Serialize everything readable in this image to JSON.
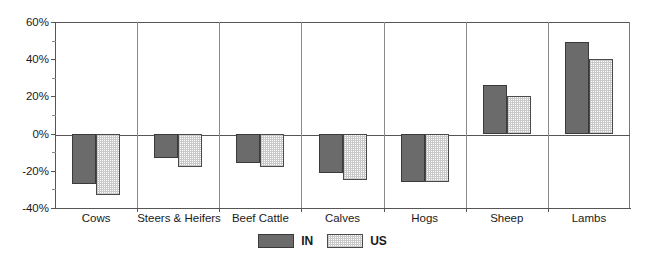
{
  "chart_data": {
    "type": "bar",
    "title": "",
    "xlabel": "",
    "ylabel": "",
    "ylim": [
      -40,
      60
    ],
    "grid": false,
    "legend_position": "bottom-center",
    "categories": [
      "Cows",
      "Steers & Heifers",
      "Beef Cattle",
      "Calves",
      "Hogs",
      "Sheep",
      "Lambs"
    ],
    "y_ticks": [
      60,
      40,
      20,
      0,
      -20,
      -40
    ],
    "y_tick_labels": [
      "60%",
      "40%",
      "20%",
      "0%",
      "-20%",
      "-40%"
    ],
    "y_minor_ticks": [
      50,
      30,
      10,
      -10,
      -30
    ],
    "series": [
      {
        "name": "IN",
        "color": "#6b6b6b",
        "values": [
          -27,
          -13,
          -16,
          -21,
          -26,
          26,
          49
        ]
      },
      {
        "name": "US",
        "color": "#d4d4d4",
        "values": [
          -33,
          -18,
          -18,
          -25,
          -26,
          20,
          40
        ]
      }
    ]
  },
  "legend": {
    "items": [
      {
        "label": "IN",
        "swatch": "dark-gray-fill-swatch"
      },
      {
        "label": "US",
        "swatch": "light-dotted-fill-swatch"
      }
    ]
  },
  "axis": {
    "y_labels": [
      "60%",
      "40%",
      "20%",
      "0%",
      "-20%",
      "-40%"
    ],
    "x_labels": [
      "Cows",
      "Steers & Heifers",
      "Beef Cattle",
      "Calves",
      "Hogs",
      "Sheep",
      "Lambs"
    ]
  }
}
